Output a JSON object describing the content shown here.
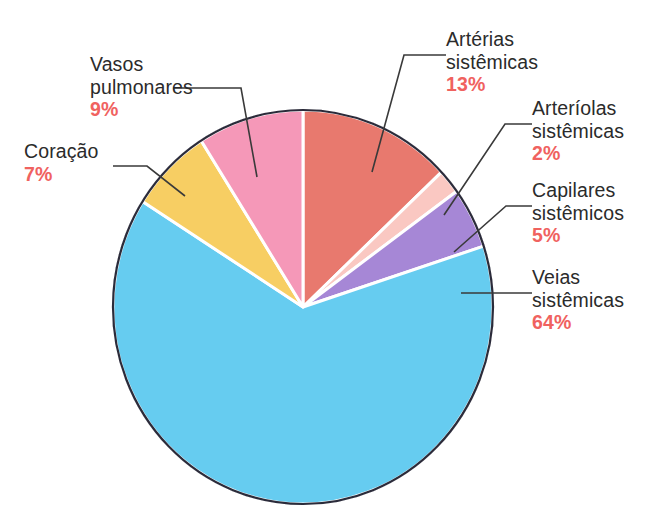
{
  "figure": {
    "background_color": "#ffffff",
    "label_text_color": "#2b2b2b",
    "percent_text_color": "#f0625f",
    "pie_outline_color": "#2b2b3a",
    "slice_separator_color": "#ffffff"
  },
  "chart_data": {
    "type": "pie",
    "title": "",
    "xlabel": "",
    "ylabel": "",
    "legend_position": "callout-labels",
    "grid": false,
    "units": "percent",
    "total": 100,
    "categories": [
      "Artérias sistêmicas",
      "Arteríolas sistêmicas",
      "Capilares sistêmicos",
      "Veias sistêmicas",
      "Coração",
      "Vasos pulmonares"
    ],
    "values": [
      13,
      2,
      5,
      64,
      7,
      9
    ],
    "labels_pct": [
      "13%",
      "2%",
      "5%",
      "64%",
      "7%",
      "9%"
    ],
    "colors": [
      "#e8796e",
      "#fac8c2",
      "#a687d6",
      "#66ccf0",
      "#f7ce63",
      "#f598b8"
    ],
    "start_angle_deg": 0,
    "direction": "clockwise",
    "slices": [
      {
        "name": "arterias-sistemicas",
        "label_line1": "Artérias",
        "label_line2": "sistêmicas",
        "percent_text": "13%",
        "value": 13,
        "color": "#e8796e"
      },
      {
        "name": "arteriolas-sistemicas",
        "label_line1": "Arteríolas",
        "label_line2": "sistêmicas",
        "percent_text": "2%",
        "value": 2,
        "color": "#fac8c2"
      },
      {
        "name": "capilares-sistemicos",
        "label_line1": "Capilares",
        "label_line2": "sistêmicos",
        "percent_text": "5%",
        "value": 5,
        "color": "#a687d6"
      },
      {
        "name": "veias-sistemicas",
        "label_line1": "Veias",
        "label_line2": "sistêmicas",
        "percent_text": "64%",
        "value": 64,
        "color": "#66ccf0"
      },
      {
        "name": "coracao",
        "label_line1": "Coração",
        "label_line2": "",
        "percent_text": "7%",
        "value": 7,
        "color": "#f7ce63"
      },
      {
        "name": "vasos-pulmonares",
        "label_line1": "Vasos",
        "label_line2": "pulmonares",
        "percent_text": "9%",
        "value": 9,
        "color": "#f598b8"
      }
    ]
  },
  "geometry": {
    "center_x": 303,
    "center_y": 307,
    "radius_x": 190,
    "radius_y": 197
  },
  "labels": {
    "arterias": {
      "line1": "Artérias",
      "line2": "sistêmicas",
      "pct": "13%"
    },
    "arteriolas": {
      "line1": "Arteríolas",
      "line2": "sistêmicas",
      "pct": "2%"
    },
    "capilares": {
      "line1": "Capilares",
      "line2": "sistêmicos",
      "pct": "5%"
    },
    "veias": {
      "line1": "Veias",
      "line2": "sistêmicas",
      "pct": "64%"
    },
    "coracao": {
      "line1": "Coração",
      "line2": "",
      "pct": "7%"
    },
    "vasos": {
      "line1": "Vasos",
      "line2": "pulmonares",
      "pct": "9%"
    }
  }
}
